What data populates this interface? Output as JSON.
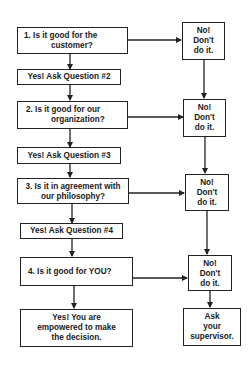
{
  "flowchart": {
    "questions": [
      {
        "line1": "1.   Is it good for the",
        "line2": "customer?"
      },
      {
        "line1": "2.  Is it good for our",
        "line2": "organization?"
      },
      {
        "line1": "3.  Is it in agreement with",
        "line2": "our philosophy?"
      },
      {
        "line1": "4.  Is it good for YOU?"
      }
    ],
    "yes_steps": [
      "Yes!  Ask Question #2",
      "Yes!  Ask Question #3",
      "Yes!  Ask Question #4"
    ],
    "final_yes": {
      "line1": "Yes!  You are",
      "line2": "empowered to make",
      "line3": "the decision."
    },
    "no_boxes": [
      {
        "line1": "No!",
        "line2": "Don't",
        "line3": "do it."
      },
      {
        "line1": "No!",
        "line2": "Don't",
        "line3": "do it."
      },
      {
        "line1": "No!",
        "line2": "Don't",
        "line3": "do it."
      },
      {
        "line1": "No!",
        "line2": "Don't",
        "line3": "do it."
      }
    ],
    "final_no": {
      "line1": "Ask",
      "line2": "your",
      "line3": "supervisor."
    }
  }
}
